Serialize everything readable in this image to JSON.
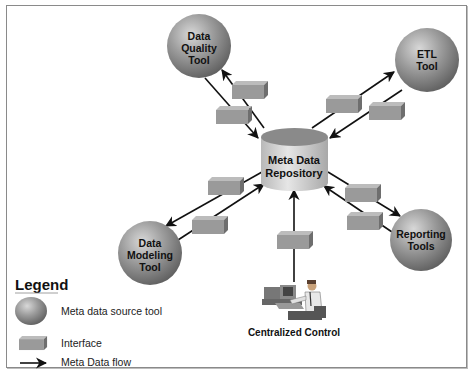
{
  "diagram": {
    "central": {
      "label_line1": "Meta Data",
      "label_line2": "Repository"
    },
    "tools": [
      {
        "id": "data-quality",
        "line1": "Data",
        "line2": "Quality",
        "line3": "Tool"
      },
      {
        "id": "etl",
        "line1": "ETL",
        "line2": "Tool"
      },
      {
        "id": "data-modeling",
        "line1": "Data",
        "line2": "Modeling",
        "line3": "Tool"
      },
      {
        "id": "reporting",
        "line1": "Reporting",
        "line2": "Tools"
      }
    ],
    "control": {
      "label": "Centralized Control"
    },
    "legend": {
      "title": "Legend",
      "items": [
        {
          "symbol": "sphere",
          "label": "Meta data source tool"
        },
        {
          "symbol": "box",
          "label": "Interface"
        },
        {
          "symbol": "arrow",
          "label": "Meta Data flow"
        }
      ]
    },
    "colors": {
      "sphere": "#8d8d8d",
      "box": "#9a9a9a",
      "cylinder_top": "#8f8f8f",
      "cylinder_body": "#d6d6d6",
      "arrow": "#111111"
    }
  }
}
